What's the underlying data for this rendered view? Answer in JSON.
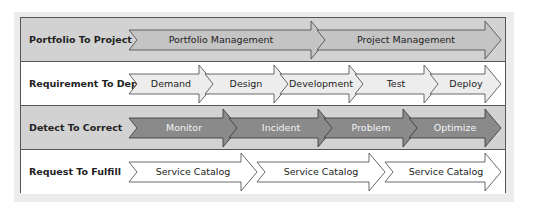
{
  "diagram": {
    "rows": [
      {
        "label": "Portfolio To Project",
        "style": "gray",
        "arrows": [
          {
            "label": "Portfolio Management"
          },
          {
            "label": "Project Management"
          }
        ]
      },
      {
        "label": "Requirement To Deploy",
        "style": "white",
        "arrows": [
          {
            "label": "Demand"
          },
          {
            "label": "Design"
          },
          {
            "label": "Development"
          },
          {
            "label": "Test"
          },
          {
            "label": "Deploy"
          }
        ]
      },
      {
        "label": "Detect To Correct",
        "style": "gray",
        "arrows": [
          {
            "label": "Monitor"
          },
          {
            "label": "Incident"
          },
          {
            "label": "Problem"
          },
          {
            "label": "Optimize"
          }
        ]
      },
      {
        "label": "Request To Fulfill",
        "style": "white",
        "arrows": [
          {
            "label": "Service Catalog"
          },
          {
            "label": "Service Catalog"
          },
          {
            "label": "Service Catalog"
          }
        ]
      }
    ],
    "colors": {
      "row_gray": "#d2d2d2",
      "row_white": "#ffffff",
      "arrow_light_gray": "#c4c4c4",
      "arrow_pale": "#ededed",
      "arrow_dark": "#8a8a8a",
      "arrow_white": "#ffffff",
      "border": "#555555"
    }
  }
}
